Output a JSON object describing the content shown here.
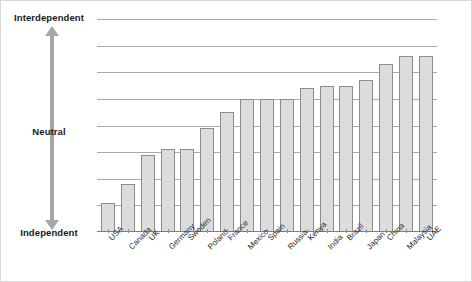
{
  "chart_data": {
    "type": "bar",
    "title": "",
    "subtitle": "",
    "xlabel": "",
    "ylabel": "",
    "grid": true,
    "legend": null,
    "axis_anchor_labels": {
      "top": "Interdependent",
      "middle": "Neutral",
      "bottom": "Independent"
    },
    "ylim": [
      0,
      8
    ],
    "ytick_count": 8,
    "ytick_values": [
      1,
      2,
      3,
      4,
      5,
      6,
      7,
      8
    ],
    "neutral_value": 5,
    "categories": [
      "USA",
      "Canada",
      "UK",
      "Germany",
      "Sweden",
      "Poland",
      "France",
      "Mexico",
      "Spain",
      "Russia",
      "Kenya",
      "India",
      "Brazil",
      "Japan",
      "China",
      "Malaysia",
      "UAE"
    ],
    "values": [
      1.1,
      1.8,
      2.9,
      3.1,
      3.1,
      3.9,
      4.5,
      5.0,
      5.0,
      5.0,
      5.4,
      5.5,
      5.5,
      5.7,
      6.3,
      6.6,
      6.6
    ],
    "bar_color": "#dcdcdc",
    "bar_edge_color": "#8c8c8c",
    "grid_color": "#a9a9a9",
    "arrow_color": "#a6a6a6",
    "text_color": "#1a1a1a"
  }
}
